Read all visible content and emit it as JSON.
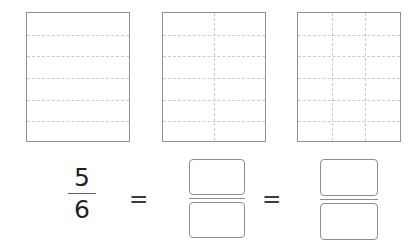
{
  "worksheet": {
    "title": "Equivalent fractions area models",
    "line_color": "#8e9295",
    "dash_color": "#c9cccf",
    "text_color": "#231f20"
  },
  "models": [
    {
      "name": "area-model-1",
      "rows": 6,
      "cols": 1,
      "total_parts": 6,
      "shaded_parts": 0,
      "horizontal_divider_count": 5,
      "vertical_divider_count": 0
    },
    {
      "name": "area-model-2",
      "rows": 6,
      "cols": 2,
      "total_parts": 12,
      "shaded_parts": 0,
      "horizontal_divider_count": 5,
      "vertical_divider_count": 1
    },
    {
      "name": "area-model-3",
      "rows": 6,
      "cols": 3,
      "total_parts": 18,
      "shaded_parts": 0,
      "horizontal_divider_count": 5,
      "vertical_divider_count": 2
    }
  ],
  "equation": {
    "given_fraction": {
      "numerator": "5",
      "denominator": "6"
    },
    "equals_1": "=",
    "equals_2": "=",
    "blank_fraction_1": {
      "numerator_value": "",
      "numerator_placeholder": "",
      "denominator_value": "",
      "denominator_placeholder": ""
    },
    "blank_fraction_2": {
      "numerator_value": "",
      "numerator_placeholder": "",
      "denominator_value": "",
      "denominator_placeholder": ""
    }
  }
}
